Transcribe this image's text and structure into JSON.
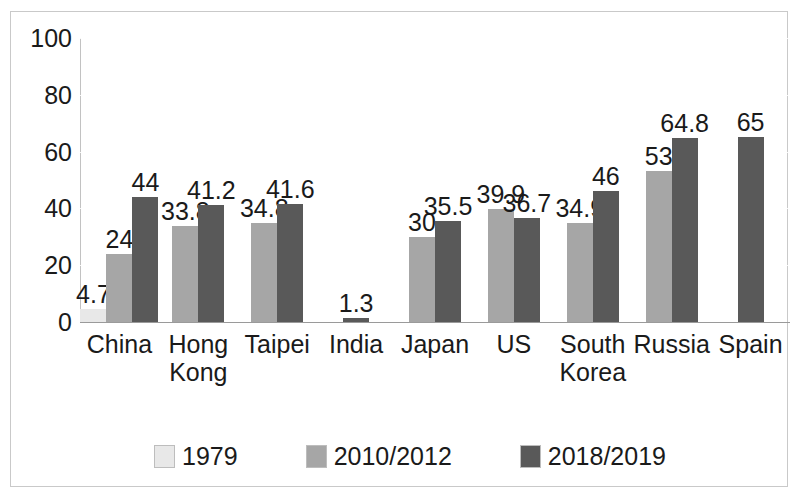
{
  "chart_data": {
    "type": "bar",
    "title": "",
    "subtitle": "",
    "xlabel": "",
    "ylabel": "",
    "ylim": [
      0,
      100
    ],
    "yticks": [
      0,
      20,
      40,
      60,
      80,
      100
    ],
    "grid": true,
    "legend_position": "bottom",
    "categories": [
      "China",
      "Hong\nKong",
      "Taipei",
      "India",
      "Japan",
      "US",
      "South\nKorea",
      "Russia",
      "Spain"
    ],
    "series": [
      {
        "name": "1979",
        "color": "#e8e8e8",
        "values": [
          4.7,
          null,
          null,
          null,
          null,
          null,
          null,
          null,
          null
        ],
        "labels": [
          "4.7",
          "",
          "",
          "",
          "",
          "",
          "",
          "",
          ""
        ]
      },
      {
        "name": "2010/2012",
        "color": "#a6a6a6",
        "values": [
          24,
          33.8,
          34.8,
          null,
          30,
          39.9,
          34.9,
          53,
          null
        ],
        "labels": [
          "24",
          "33.8",
          "34.8",
          "",
          "30",
          "39.9",
          "34.9",
          "53",
          ""
        ]
      },
      {
        "name": "2018/2019",
        "color": "#595959",
        "values": [
          44,
          41.2,
          41.6,
          1.3,
          35.5,
          36.7,
          46,
          64.8,
          65
        ],
        "labels": [
          "44",
          "41.2",
          "41.6",
          "1.3",
          "35.5",
          "36.7",
          "46",
          "64.8",
          "65"
        ]
      }
    ]
  },
  "colors": {
    "series_1979": "#e8e8e8",
    "series_2010_2012": "#a6a6a6",
    "series_2018_2019": "#595959",
    "axis": "#9a9a9a",
    "frame": "#c9c9c9",
    "text": "#1a1a1a",
    "background": "#ffffff"
  },
  "legend": {
    "items": [
      {
        "label": "1979",
        "color": "#e8e8e8"
      },
      {
        "label": "2010/2012",
        "color": "#a6a6a6"
      },
      {
        "label": "2018/2019",
        "color": "#595959"
      }
    ]
  },
  "axis": {
    "y_tick_labels": [
      "100",
      "80",
      "60",
      "40",
      "20",
      "0"
    ]
  }
}
